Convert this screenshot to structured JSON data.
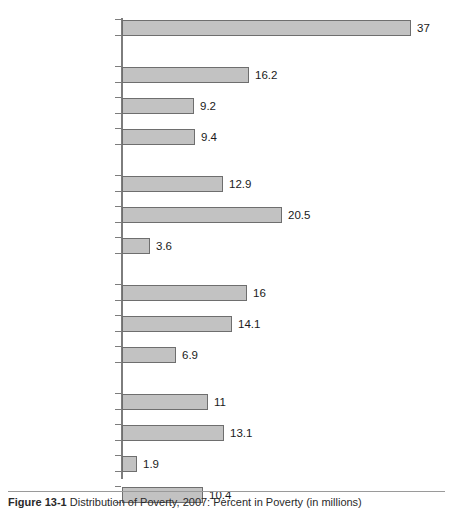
{
  "figure": {
    "caption_label": "Figure 13-1",
    "caption_text": "Distribution of Poverty, 2007: Percent in Poverty (in millions)"
  },
  "chart_data": {
    "type": "bar",
    "orientation": "horizontal",
    "title": "",
    "xlabel": "",
    "ylabel": "",
    "grid": false,
    "legend": null,
    "axis_line": true,
    "xlim": [
      0,
      42
    ],
    "categories": [
      "All",
      "White",
      "Black",
      "Hispanic",
      "Under 18",
      "18–64",
      "Over 65",
      "Central city",
      "Suburban",
      "Smaller urban/rural",
      "In dual-head family",
      "In female-head family",
      "In male-head family",
      "Unrelated individuals"
    ],
    "values": [
      37,
      16.2,
      9.2,
      9.4,
      12.9,
      20.5,
      3.6,
      16,
      14.1,
      6.9,
      11,
      13.1,
      1.9,
      10.4
    ],
    "value_labels": [
      "37",
      "16.2",
      "9.2",
      "9.4",
      "12.9",
      "20.5",
      "3.6",
      "16",
      "14.1",
      "6.9",
      "11",
      "13.1",
      "1.9",
      "10.4"
    ],
    "groups": [
      {
        "name": "total",
        "indices": [
          0
        ]
      },
      {
        "name": "race-ethnicity",
        "indices": [
          1,
          2,
          3
        ]
      },
      {
        "name": "age",
        "indices": [
          4,
          5,
          6
        ]
      },
      {
        "name": "location",
        "indices": [
          7,
          8,
          9
        ]
      },
      {
        "name": "family-status",
        "indices": [
          10,
          11,
          12,
          13
        ]
      }
    ],
    "colors": {
      "bar_fill": "#c2c2c2",
      "bar_border": "#6e6e6e",
      "axis": "#7d7d7d",
      "text": "#1a1a1a",
      "background": "#ffffff"
    }
  },
  "bars": [
    {
      "label": "All",
      "value_label": "37",
      "top": 24,
      "width": 289
    },
    {
      "label": "White",
      "value_label": "16.2",
      "top": 71,
      "width": 127
    },
    {
      "label": "Black",
      "value_label": "9.2",
      "top": 102,
      "width": 72
    },
    {
      "label": "Hispanic",
      "value_label": "9.4",
      "top": 133,
      "width": 73
    },
    {
      "label": "Under 18",
      "value_label": "12.9",
      "top": 180,
      "width": 101
    },
    {
      "label": "18–64",
      "value_label": "20.5",
      "top": 211,
      "width": 160
    },
    {
      "label": "Over 65",
      "value_label": "3.6",
      "top": 242,
      "width": 28
    },
    {
      "label": "Central city",
      "value_label": "16",
      "top": 289,
      "width": 125
    },
    {
      "label": "Suburban",
      "value_label": "14.1",
      "top": 320,
      "width": 110
    },
    {
      "label": "Smaller urban/rural",
      "value_label": "6.9",
      "top": 351,
      "width": 54
    },
    {
      "label": "In dual-head family",
      "value_label": "11",
      "top": 398,
      "width": 86
    },
    {
      "label": "In female-head family",
      "value_label": "13.1",
      "top": 429,
      "width": 102
    },
    {
      "label": "In male-head family",
      "value_label": "1.9",
      "top": 460,
      "width": 15
    },
    {
      "label": "Unrelated individuals",
      "value_label": "10.4",
      "top": 491,
      "width": 81
    }
  ]
}
